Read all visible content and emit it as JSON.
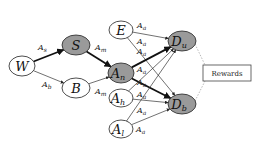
{
  "colors": {
    "shaded_node": "#9a9a9a",
    "plain_node": "#ffffff",
    "stroke": "#222222",
    "dotted": "#9a9a9a"
  },
  "nodes": [
    {
      "id": "W",
      "base": "W",
      "sub": "",
      "shaded": false,
      "cx": 22,
      "cy": 66,
      "rx": 13,
      "ry": 10
    },
    {
      "id": "S",
      "base": "S",
      "sub": "",
      "shaded": true,
      "cx": 76,
      "cy": 45,
      "rx": 14,
      "ry": 10
    },
    {
      "id": "B",
      "base": "B",
      "sub": "",
      "shaded": false,
      "cx": 76,
      "cy": 88,
      "rx": 14,
      "ry": 10
    },
    {
      "id": "E",
      "base": "E",
      "sub": "",
      "shaded": false,
      "cx": 121,
      "cy": 30,
      "rx": 12,
      "ry": 9
    },
    {
      "id": "An",
      "base": "A",
      "sub": "n",
      "shaded": true,
      "cx": 121,
      "cy": 73,
      "rx": 13,
      "ry": 10
    },
    {
      "id": "Ah",
      "base": "A",
      "sub": "h",
      "shaded": false,
      "cx": 121,
      "cy": 98,
      "rx": 12,
      "ry": 9
    },
    {
      "id": "Al",
      "base": "A",
      "sub": "l",
      "shaded": false,
      "cx": 121,
      "cy": 129,
      "rx": 12,
      "ry": 9
    },
    {
      "id": "Du",
      "base": "D",
      "sub": "u",
      "shaded": true,
      "cx": 182,
      "cy": 41,
      "rx": 14,
      "ry": 10
    },
    {
      "id": "Db",
      "base": "D",
      "sub": "b",
      "shaded": true,
      "cx": 182,
      "cy": 104,
      "rx": 14,
      "ry": 10
    }
  ],
  "edges": [
    {
      "from": "W",
      "to": "S",
      "label_base": "A",
      "label_sub": "s",
      "bold": true,
      "lx": 38,
      "ly": 50
    },
    {
      "from": "W",
      "to": "B",
      "label_base": "A",
      "label_sub": "b",
      "bold": false,
      "lx": 42,
      "ly": 87
    },
    {
      "from": "S",
      "to": "An",
      "label_base": "A",
      "label_sub": "m",
      "bold": true,
      "lx": 95,
      "ly": 50
    },
    {
      "from": "B",
      "to": "An",
      "label_base": "A",
      "label_sub": "m",
      "bold": false,
      "lx": 95,
      "ly": 94
    },
    {
      "from": "E",
      "to": "Du",
      "label_base": "A",
      "label_sub": "a",
      "bold": false,
      "lx": 137,
      "ly": 28
    },
    {
      "from": "E",
      "to": "Db",
      "label_base": "A",
      "label_sub": "a",
      "bold": false,
      "lx": 137,
      "ly": 44
    },
    {
      "from": "An",
      "to": "Du",
      "label_base": "A",
      "label_sub": "a",
      "bold": true,
      "lx": 137,
      "ly": 54
    },
    {
      "from": "An",
      "to": "Db",
      "label_base": "A",
      "label_sub": "a",
      "bold": true,
      "lx": 137,
      "ly": 72
    },
    {
      "from": "Ah",
      "to": "Du",
      "label_base": "A",
      "label_sub": "a",
      "bold": false,
      "lx": 137,
      "ly": 85
    },
    {
      "from": "Ah",
      "to": "Db",
      "label_base": "A",
      "label_sub": "a",
      "bold": false,
      "lx": 137,
      "ly": 97
    },
    {
      "from": "Al",
      "to": "Du",
      "label_base": "A",
      "label_sub": "a",
      "bold": false,
      "lx": 137,
      "ly": 113
    },
    {
      "from": "Al",
      "to": "Db",
      "label_base": "A",
      "label_sub": "a",
      "bold": false,
      "lx": 136,
      "ly": 132
    }
  ],
  "rewards": {
    "label": "Rewards",
    "x": 203,
    "y": 65,
    "width": 48,
    "height": 16
  }
}
